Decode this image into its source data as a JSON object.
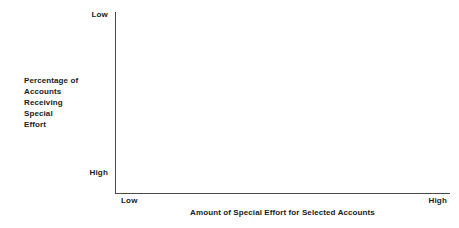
{
  "chart_data": {
    "type": "scatter",
    "title": "",
    "subtitle": "",
    "xlabel": "Amount of Special Effort for Selected Accounts",
    "ylabel": "Percentage of Accounts Receiving Special Effort",
    "ylabel_lines": [
      "Percentage of",
      "Accounts",
      "Receiving",
      "Special",
      "Effort"
    ],
    "x_tick_labels": [
      "Low",
      "High"
    ],
    "y_tick_labels": [
      "Low",
      "High"
    ],
    "x_axis_low_label": "Low",
    "x_axis_high_label": "High",
    "y_axis_top_label": "Low",
    "y_axis_bottom_label": "High",
    "series": [],
    "values": [],
    "categories": [],
    "grid": false,
    "legend": false,
    "legend_position": "none",
    "annotations": [],
    "note": "Empty plotting frame: L-shaped axes with ordinal Low/High endpoints and no plotted data."
  },
  "style": {
    "background_color": "#ffffff",
    "axis_color": "#4a4a4a",
    "text_color": "#1a1a1a"
  }
}
